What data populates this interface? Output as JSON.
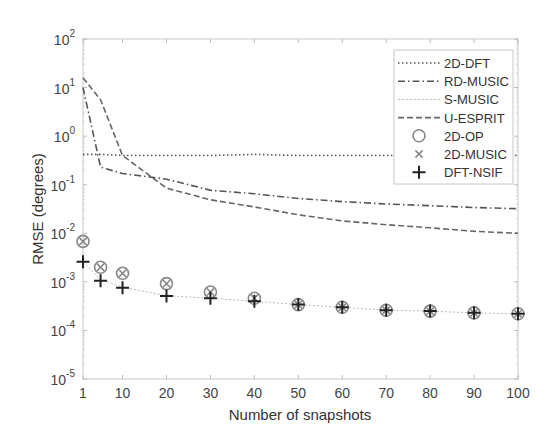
{
  "chart_data": {
    "type": "line",
    "title": "",
    "xlabel": "Number of snapshots",
    "ylabel": "RMSE (degrees)",
    "xlim": [
      1,
      100
    ],
    "ylim": [
      1e-05,
      100
    ],
    "yscale": "log",
    "grid": false,
    "legend_position": "top-right",
    "x_ticks": [
      1,
      10,
      20,
      30,
      40,
      50,
      60,
      70,
      80,
      90,
      100
    ],
    "x_tick_labels": [
      "1",
      "10",
      "20",
      "30",
      "40",
      "50",
      "60",
      "70",
      "80",
      "90",
      "100"
    ],
    "y_ticks": [
      {
        "base": "10",
        "exp": "-5",
        "value": 1e-05
      },
      {
        "base": "10",
        "exp": "-4",
        "value": 0.0001
      },
      {
        "base": "10",
        "exp": "-3",
        "value": 0.001
      },
      {
        "base": "10",
        "exp": "-2",
        "value": 0.01
      },
      {
        "base": "10",
        "exp": "-1",
        "value": 0.1
      },
      {
        "base": "10",
        "exp": "0",
        "value": 1
      },
      {
        "base": "10",
        "exp": "1",
        "value": 10
      },
      {
        "base": "10",
        "exp": "2",
        "value": 100
      }
    ],
    "series": [
      {
        "name": "2D-DFT",
        "style": "dotted",
        "color": "#555555",
        "x": [
          1,
          5,
          10,
          20,
          30,
          40,
          50,
          60,
          70,
          80,
          90,
          100
        ],
        "values": [
          0.42,
          0.42,
          0.4,
          0.4,
          0.4,
          0.42,
          0.4,
          0.4,
          0.4,
          0.4,
          0.4,
          0.4
        ]
      },
      {
        "name": "RD-MUSIC",
        "style": "dashdot",
        "color": "#555555",
        "x": [
          1,
          5,
          10,
          20,
          30,
          40,
          50,
          60,
          70,
          80,
          90,
          100
        ],
        "values": [
          10,
          0.23,
          0.17,
          0.13,
          0.077,
          0.065,
          0.052,
          0.045,
          0.04,
          0.037,
          0.034,
          0.032
        ]
      },
      {
        "name": "S-MUSIC",
        "style": "light-dotted",
        "color": "#bbbbbb",
        "x": [
          1,
          5,
          10,
          20,
          30,
          40,
          50,
          60,
          70,
          80,
          90,
          100
        ],
        "values": [
          0.0026,
          0.0011,
          0.00078,
          0.00052,
          0.00046,
          0.0004,
          0.00034,
          0.0003,
          0.00026,
          0.00025,
          0.00023,
          0.00022
        ]
      },
      {
        "name": "U-ESPRIT",
        "style": "dashed",
        "color": "#666666",
        "x": [
          1,
          5,
          10,
          20,
          30,
          40,
          50,
          60,
          70,
          80,
          90,
          100
        ],
        "values": [
          16,
          5.6,
          0.4,
          0.085,
          0.049,
          0.035,
          0.024,
          0.018,
          0.015,
          0.013,
          0.011,
          0.01
        ]
      },
      {
        "name": "2D-OP",
        "style": "marker-circle",
        "color": "#888888",
        "x": [
          1,
          5,
          10,
          20,
          30,
          40,
          50,
          60,
          70,
          80,
          90,
          100
        ],
        "values": [
          0.0068,
          0.002,
          0.0015,
          0.00092,
          0.00062,
          0.00046,
          0.00034,
          0.0003,
          0.00026,
          0.00025,
          0.00023,
          0.00022
        ]
      },
      {
        "name": "2D-MUSIC",
        "style": "marker-x",
        "color": "#888888",
        "x": [
          1,
          5,
          10,
          20,
          30,
          40,
          50,
          60,
          70,
          80,
          90,
          100
        ],
        "values": [
          0.0068,
          0.002,
          0.0015,
          0.00092,
          0.00062,
          0.00046,
          0.00034,
          0.0003,
          0.00026,
          0.00025,
          0.00023,
          0.00022
        ]
      },
      {
        "name": "DFT-NSIF",
        "style": "marker-plus",
        "color": "#222222",
        "x": [
          1,
          5,
          10,
          20,
          30,
          40,
          50,
          60,
          70,
          80,
          90,
          100
        ],
        "values": [
          0.0026,
          0.00105,
          0.00076,
          0.00051,
          0.00046,
          0.0004,
          0.00034,
          0.0003,
          0.00026,
          0.00025,
          0.00023,
          0.00022
        ]
      }
    ]
  }
}
